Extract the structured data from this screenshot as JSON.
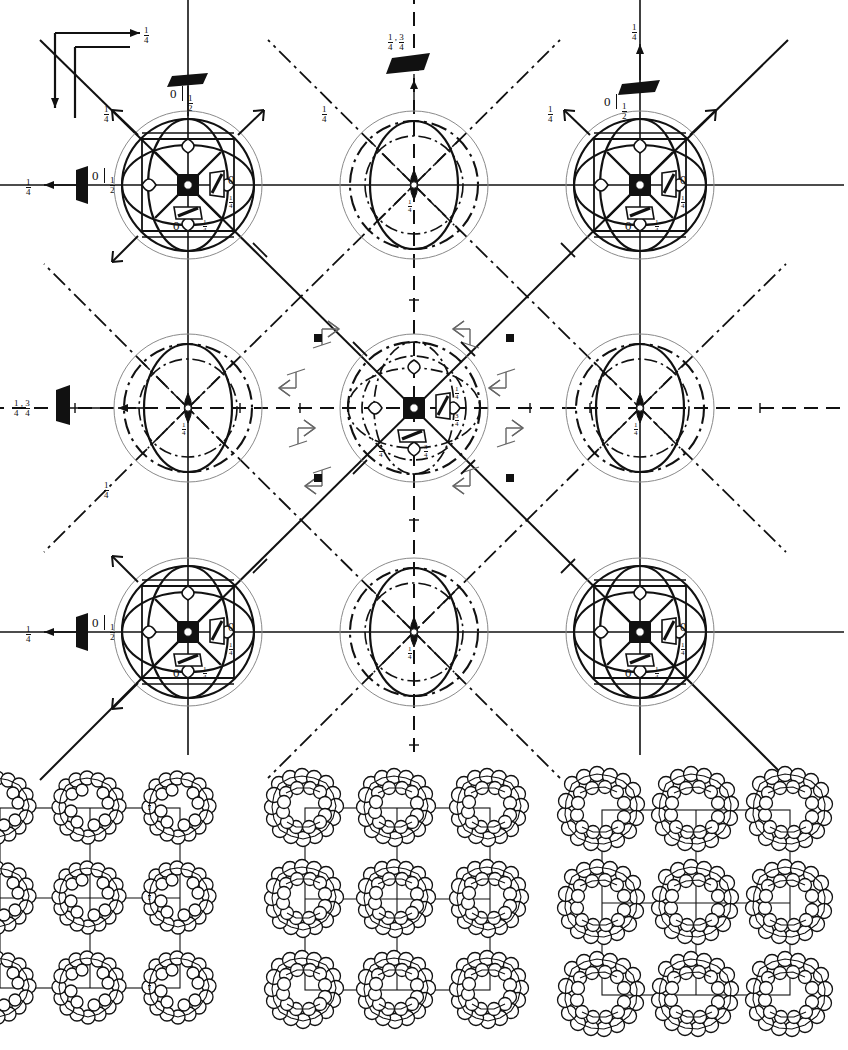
{
  "figure": {
    "kind": "space-group-symmetry-and-packing-diagram",
    "panels": [
      "symmetry-diagram",
      "packing-diagram-1",
      "packing-diagram-2",
      "packing-diagram-3"
    ]
  },
  "axes_indicator": {
    "name": "axes-cross",
    "right_arrow_label": "1/4",
    "right_arrow_num": "1",
    "right_arrow_den": "4",
    "down_arrow_label": ""
  },
  "symmetry_diagram": {
    "grid": {
      "cols": 3,
      "rows": 3
    },
    "corner_site_labels": {
      "right_zero": "0",
      "right_fraction_num": "1",
      "right_fraction_den": "4",
      "bottom_zero": "0",
      "bottom_fraction_num": "1",
      "bottom_fraction_den": "4"
    },
    "center_site_labels": {
      "right_upper_num": "1",
      "right_upper_den": "4",
      "right_lower_num": "3",
      "right_lower_den": "4",
      "bottom_left_num": "1",
      "bottom_left_den": "4",
      "bottom_right_num": "3",
      "bottom_right_den": "4"
    },
    "edge_site_labels": {
      "num": "1",
      "den": "4"
    },
    "margin_labels": [
      {
        "id": "top-left-glide",
        "zero": "0",
        "num": "1",
        "den": "2"
      },
      {
        "id": "top-middle-glide",
        "left_num": "1",
        "left_den": "4",
        "right_num": "3",
        "right_den": "4"
      },
      {
        "id": "top-right-glide",
        "zero": "0",
        "num": "1",
        "den": "2",
        "arrow_num": "1",
        "arrow_den": "4"
      },
      {
        "id": "left-top-glide",
        "zero": "0",
        "num": "1",
        "den": "2",
        "arrow_num": "1",
        "arrow_den": "4"
      },
      {
        "id": "left-middle-glide",
        "left_num": "1",
        "left_den": "4",
        "right_num": "3",
        "right_den": "4"
      },
      {
        "id": "left-bottom-glide",
        "zero": "0",
        "num": "1",
        "den": "2",
        "arrow_num": "1",
        "arrow_den": "4"
      }
    ],
    "corner_arrow_labels": [
      {
        "id": "arrow-ul",
        "num": "1",
        "den": "4"
      },
      {
        "id": "arrow-ur-top",
        "num": "1",
        "den": "4"
      },
      {
        "id": "arrow-ll",
        "num": "1",
        "den": "4"
      },
      {
        "id": "arrow-top-c",
        "num": "1",
        "den": "4"
      }
    ],
    "element_names": [
      "4-fold-rotoinversion-axis",
      "3-fold-axis",
      "2-fold-axis",
      "mirror-plane",
      "n-glide-plane",
      "diagonal-glide-plane",
      "inversion-centre",
      "screw-axis"
    ]
  },
  "packing_diagrams": [
    {
      "id": "packing-1",
      "cell_label_num": "1",
      "cell_label_den": "2",
      "rows": 3,
      "cols": 3,
      "cluster_type": "ring-of-spheres",
      "spheres_per_cluster": 24
    },
    {
      "id": "packing-2",
      "cell_label_num": "",
      "cell_label_den": "",
      "rows": 3,
      "cols": 3,
      "cluster_type": "ring-of-spheres",
      "spheres_per_cluster": 24
    },
    {
      "id": "packing-3",
      "cell_label_num": "",
      "cell_label_den": "",
      "rows": 3,
      "cols": 3,
      "cluster_type": "ring-of-spheres",
      "spheres_per_cluster": 24
    }
  ],
  "colors": {
    "ink": "#111111",
    "light_ink": "#777777",
    "paper": "#ffffff"
  }
}
